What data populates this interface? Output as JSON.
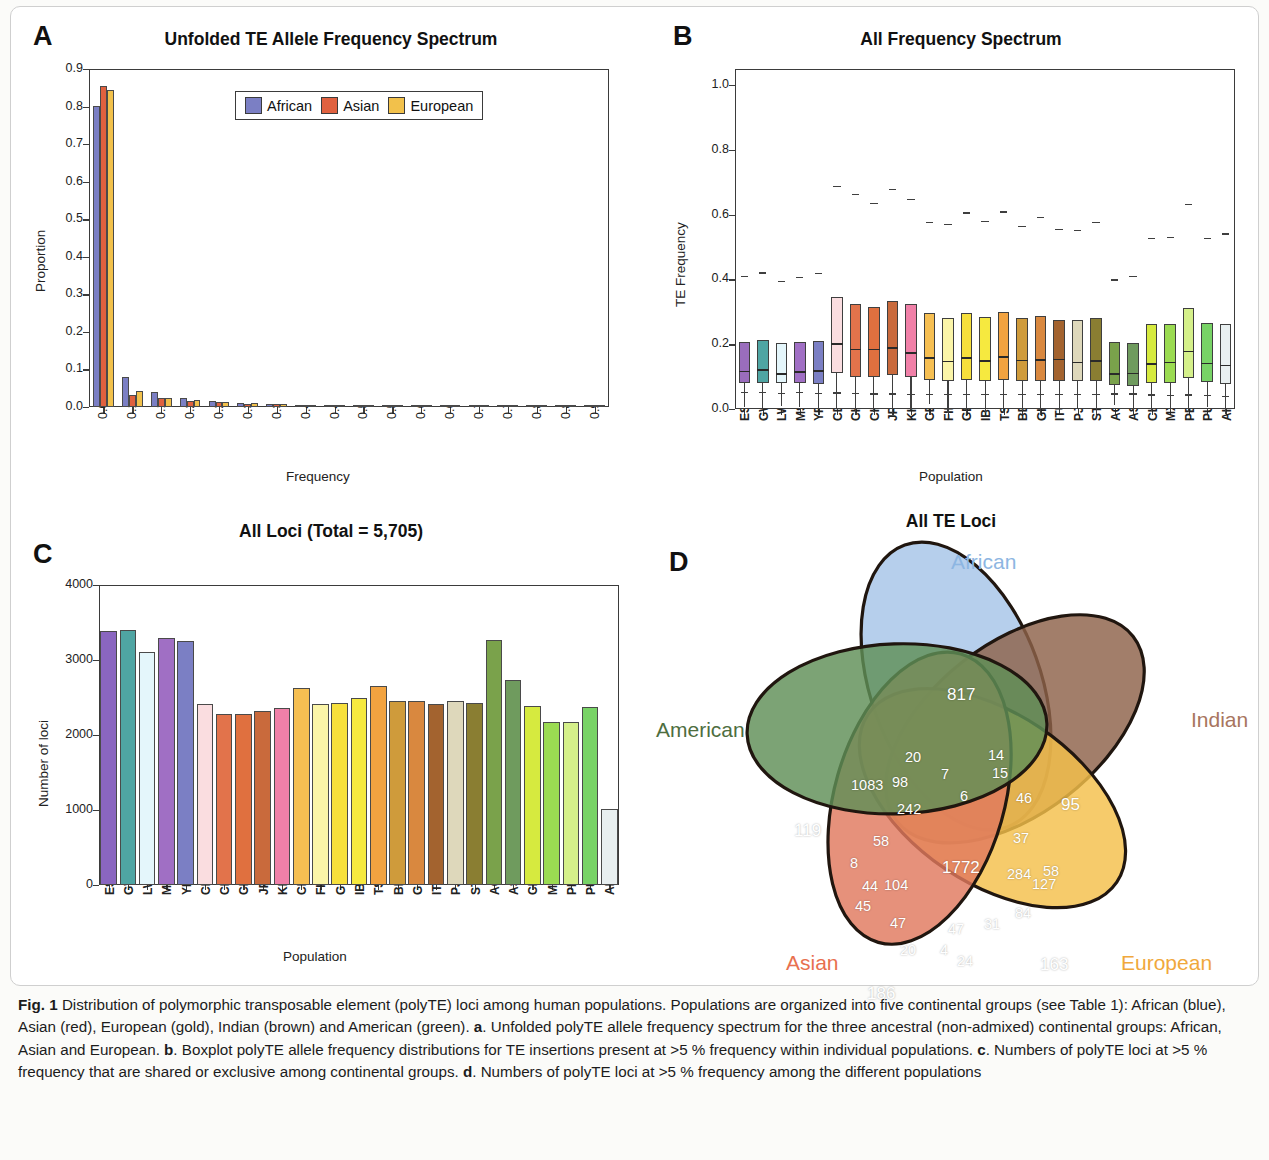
{
  "figure": {
    "panelA_letter": "A",
    "panelB_letter": "B",
    "panelC_letter": "C",
    "panelD_letter": "D"
  },
  "caption": {
    "fig_label": "Fig. 1",
    "text": " Distribution of polymorphic transposable element (polyTE) loci among human populations. Populations are organized into five continental groups (see Table 1): African (blue), Asian (red), European (gold), Indian (brown) and American (green). ",
    "a_label": "a",
    "a_text": ". Unfolded polyTE allele frequency spectrum for the three ancestral (non-admixed) continental groups: African, Asian and European. ",
    "b_label": "b",
    "b_text": ". Boxplot polyTE allele frequency distributions for TE insertions present at >5 % frequency within individual populations. ",
    "c_label": "c",
    "c_text": ". Numbers of polyTE loci at >5 % frequency that are shared or exclusive among continental groups. ",
    "d_label": "d",
    "d_text": ". Numbers of polyTE loci at >5 % frequency among the different populations"
  },
  "chart_data": [
    {
      "panel": "A",
      "type": "bar",
      "title": "Unfolded TE Allele Frequency Spectrum",
      "xlabel": "Frequency",
      "ylabel": "Proportion",
      "ylim": [
        0,
        0.9
      ],
      "yticks": [
        "0.0",
        "0.1",
        "0.2",
        "0.3",
        "0.4",
        "0.5",
        "0.6",
        "0.7",
        "0.8",
        "0.9"
      ],
      "categories": [
        "0.05",
        "0.10",
        "0.15",
        "0.20",
        "0.25",
        "0.30",
        "0.35",
        "0.40",
        "0.45",
        "0.50",
        "0.55",
        "0.60",
        "0.65",
        "0.70",
        "0.75",
        "0.80",
        "0.85",
        "0.90"
      ],
      "legend": [
        "African",
        "Asian",
        "European"
      ],
      "legend_colors": [
        "#7b7fc4",
        "#e0613f",
        "#f2c14b"
      ],
      "grid": false,
      "series": [
        {
          "name": "African",
          "color": "#7b7fc4",
          "values": [
            0.801,
            0.079,
            0.041,
            0.023,
            0.016,
            0.01,
            0.007,
            0.005,
            0.003,
            0.002,
            0.0015,
            0.001,
            0.0008,
            0.0005,
            0.0004,
            0.0002,
            0.0001,
            0.0001
          ]
        },
        {
          "name": "Asian",
          "color": "#e0613f",
          "values": [
            0.855,
            0.033,
            0.025,
            0.017,
            0.013,
            0.009,
            0.007,
            0.005,
            0.003,
            0.002,
            0.0015,
            0.001,
            0.0008,
            0.0005,
            0.0004,
            0.0002,
            0.0001,
            0.0001
          ]
        },
        {
          "name": "European",
          "color": "#f2c14b",
          "values": [
            0.843,
            0.043,
            0.024,
            0.018,
            0.014,
            0.01,
            0.008,
            0.005,
            0.004,
            0.002,
            0.0015,
            0.001,
            0.0008,
            0.0005,
            0.0004,
            0.0002,
            0.0001,
            0.0001
          ]
        }
      ]
    },
    {
      "panel": "B",
      "type": "boxplot",
      "title": "All Frequency Spectrum",
      "xlabel": "Population",
      "ylabel": "TE Frequency",
      "ylim": [
        0,
        1.05
      ],
      "yticks": [
        "0.0",
        "0.2",
        "0.4",
        "0.6",
        "0.8",
        "1.0"
      ],
      "categories": [
        "ESN",
        "GWD",
        "LWK",
        "MSL",
        "YRI",
        "CDX",
        "CHB",
        "CHS",
        "JPT",
        "KHV",
        "CEU",
        "FIN",
        "GBR",
        "IBS",
        "TSI",
        "BEB",
        "GIH",
        "ITU",
        "PJL",
        "STU",
        "ACB",
        "ASW",
        "CLM",
        "MXL",
        "PEL",
        "PUR",
        "All"
      ],
      "boxes": [
        {
          "label": "ESN",
          "color": "#9a6dbd",
          "low": 0.052,
          "q1": 0.079,
          "med": 0.118,
          "q3": 0.208,
          "high": 0.41
        },
        {
          "label": "GWD",
          "color": "#4fa5a3",
          "low": 0.052,
          "q1": 0.079,
          "med": 0.122,
          "q3": 0.213,
          "high": 0.422
        },
        {
          "label": "LWK",
          "color": "#e4f6fb",
          "low": 0.05,
          "q1": 0.079,
          "med": 0.11,
          "q3": 0.203,
          "high": 0.396
        },
        {
          "label": "MSL",
          "color": "#a06fc4",
          "low": 0.052,
          "q1": 0.079,
          "med": 0.116,
          "q3": 0.208,
          "high": 0.409
        },
        {
          "label": "YRI",
          "color": "#7b7fc4",
          "low": 0.05,
          "q1": 0.077,
          "med": 0.12,
          "q3": 0.21,
          "high": 0.42
        },
        {
          "label": "CDX",
          "color": "#fadde0",
          "low": 0.051,
          "q1": 0.11,
          "med": 0.203,
          "q3": 0.346,
          "high": 0.69
        },
        {
          "label": "CHB",
          "color": "#e2734b",
          "low": 0.05,
          "q1": 0.099,
          "med": 0.186,
          "q3": 0.325,
          "high": 0.665
        },
        {
          "label": "CHS",
          "color": "#e0703f",
          "low": 0.048,
          "q1": 0.098,
          "med": 0.186,
          "q3": 0.314,
          "high": 0.637
        },
        {
          "label": "JPT",
          "color": "#c96a3c",
          "low": 0.048,
          "q1": 0.104,
          "med": 0.191,
          "q3": 0.334,
          "high": 0.68
        },
        {
          "label": "KHV",
          "color": "#f080a8",
          "low": 0.046,
          "q1": 0.1,
          "med": 0.176,
          "q3": 0.324,
          "high": 0.65
        },
        {
          "label": "CEU",
          "color": "#f6bf52",
          "low": 0.047,
          "q1": 0.089,
          "med": 0.16,
          "q3": 0.297,
          "high": 0.578
        },
        {
          "label": "FIN",
          "color": "#fbf5a8",
          "low": 0.046,
          "q1": 0.086,
          "med": 0.149,
          "q3": 0.28,
          "high": 0.572
        },
        {
          "label": "GBR",
          "color": "#f7e03c",
          "low": 0.047,
          "q1": 0.089,
          "med": 0.161,
          "q3": 0.296,
          "high": 0.607
        },
        {
          "label": "IBS",
          "color": "#f6e93f",
          "low": 0.046,
          "q1": 0.087,
          "med": 0.151,
          "q3": 0.285,
          "high": 0.582
        },
        {
          "label": "TSI",
          "color": "#f2a340",
          "low": 0.046,
          "q1": 0.09,
          "med": 0.163,
          "q3": 0.301,
          "high": 0.61
        },
        {
          "label": "BEB",
          "color": "#cf9b3b",
          "low": 0.047,
          "q1": 0.086,
          "med": 0.152,
          "q3": 0.28,
          "high": 0.566
        },
        {
          "label": "GIH",
          "color": "#d9883f",
          "low": 0.047,
          "q1": 0.087,
          "med": 0.154,
          "q3": 0.288,
          "high": 0.594
        },
        {
          "label": "ITU",
          "color": "#a3632f",
          "low": 0.047,
          "q1": 0.086,
          "med": 0.155,
          "q3": 0.276,
          "high": 0.556
        },
        {
          "label": "PJL",
          "color": "#ded8bb",
          "low": 0.046,
          "q1": 0.085,
          "med": 0.146,
          "q3": 0.276,
          "high": 0.552
        },
        {
          "label": "STU",
          "color": "#8a7e32",
          "low": 0.046,
          "q1": 0.086,
          "med": 0.151,
          "q3": 0.281,
          "high": 0.578
        },
        {
          "label": "ACB",
          "color": "#7aa24b",
          "low": 0.048,
          "q1": 0.075,
          "med": 0.11,
          "q3": 0.206,
          "high": 0.4
        },
        {
          "label": "ASW",
          "color": "#6f9b5e",
          "low": 0.048,
          "q1": 0.072,
          "med": 0.112,
          "q3": 0.204,
          "high": 0.41
        },
        {
          "label": "CLM",
          "color": "#d6ea3f",
          "low": 0.045,
          "q1": 0.081,
          "med": 0.142,
          "q3": 0.261,
          "high": 0.528
        },
        {
          "label": "MXL",
          "color": "#9bdb52",
          "low": 0.044,
          "q1": 0.081,
          "med": 0.146,
          "q3": 0.264,
          "high": 0.531
        },
        {
          "label": "PEL",
          "color": "#d5f08a",
          "low": 0.045,
          "q1": 0.095,
          "med": 0.18,
          "q3": 0.313,
          "high": 0.634
        },
        {
          "label": "PUR",
          "color": "#78d366",
          "low": 0.044,
          "q1": 0.083,
          "med": 0.143,
          "q3": 0.267,
          "high": 0.528
        },
        {
          "label": "All",
          "color": "#e8eff0",
          "low": 0.04,
          "q1": 0.076,
          "med": 0.137,
          "q3": 0.263,
          "high": 0.542
        }
      ]
    },
    {
      "panel": "C",
      "type": "bar",
      "title": "All Loci (Total = 5,705)",
      "xlabel": "Population",
      "ylabel": "Number of loci",
      "ylim": [
        0,
        4000
      ],
      "yticks": [
        "0",
        "1000",
        "2000",
        "3000",
        "4000"
      ],
      "categories": [
        "ESN",
        "GWD",
        "LWK",
        "MSL",
        "YRI",
        "CDX",
        "CHB",
        "CHS",
        "JPT",
        "KHV",
        "CEU",
        "FIN",
        "GBR",
        "IBS",
        "TSI",
        "BEB",
        "GIH",
        "ITU",
        "PJL",
        "STU",
        "ACB",
        "ASW",
        "CLM",
        "MXL",
        "PEL",
        "PUR",
        "All"
      ],
      "values": [
        3385,
        3400,
        3110,
        3290,
        3250,
        2410,
        2285,
        2275,
        2315,
        2360,
        2625,
        2420,
        2430,
        2490,
        2655,
        2460,
        2450,
        2420,
        2455,
        2430,
        3265,
        2735,
        2390,
        2180,
        2170,
        2375,
        1020
      ],
      "colors": [
        "#8a66c0",
        "#4fa5a3",
        "#e4f6fb",
        "#a06fc4",
        "#7b7fc4",
        "#fadde0",
        "#e2734b",
        "#e0703f",
        "#c96a3c",
        "#f080a8",
        "#f6bf52",
        "#fbf5a8",
        "#f7e03c",
        "#f6e93f",
        "#f2a340",
        "#cf9b3b",
        "#d9883f",
        "#a3632f",
        "#ded8bb",
        "#8a7e32",
        "#7aa24b",
        "#6f9b5e",
        "#d6ea3f",
        "#9bdb52",
        "#d5f08a",
        "#78d366",
        "#e8eff0"
      ],
      "grid": false
    },
    {
      "panel": "D",
      "type": "venn",
      "title": "All TE Loci",
      "set_labels": [
        "African",
        "Indian",
        "European",
        "Asian",
        "American"
      ],
      "set_label_colors": {
        "African": "#8db6e2",
        "Indian": "#a8755e",
        "European": "#f0a83c",
        "Asian": "#e8704f",
        "American": "#4e6e3f"
      },
      "set_fill_colors": {
        "African": "#a6c4e8",
        "Indian": "#8d6249",
        "European": "#f4c04a",
        "Asian": "#e0795e",
        "American": "#5f8f57"
      },
      "exclusive": {
        "African": "817",
        "Indian": "95",
        "European": "163",
        "Asian": "186",
        "American": "119"
      },
      "center": "1772",
      "regions": [
        {
          "value": "817"
        },
        {
          "value": "20"
        },
        {
          "value": "14"
        },
        {
          "value": "7"
        },
        {
          "value": "15"
        },
        {
          "value": "1083"
        },
        {
          "value": "98"
        },
        {
          "value": "6"
        },
        {
          "value": "46"
        },
        {
          "value": "95"
        },
        {
          "value": "242"
        },
        {
          "value": "119"
        },
        {
          "value": "58"
        },
        {
          "value": "37"
        },
        {
          "value": "8"
        },
        {
          "value": "1772"
        },
        {
          "value": "284"
        },
        {
          "value": "58"
        },
        {
          "value": "127"
        },
        {
          "value": "44"
        },
        {
          "value": "104"
        },
        {
          "value": "45"
        },
        {
          "value": "84"
        },
        {
          "value": "47"
        },
        {
          "value": "47"
        },
        {
          "value": "31"
        },
        {
          "value": "20"
        },
        {
          "value": "4"
        },
        {
          "value": "24"
        },
        {
          "value": "163"
        },
        {
          "value": "186"
        }
      ]
    }
  ]
}
